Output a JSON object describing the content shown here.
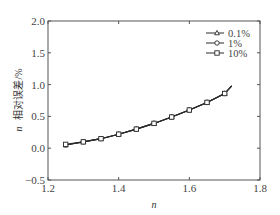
{
  "chart_data": {
    "type": "line",
    "title": "",
    "xlabel": "n",
    "ylabel": "n 相对误差/%",
    "ylabel_parts": {
      "var": "n",
      "text": "相对误差/%"
    },
    "xlim": [
      1.2,
      1.8
    ],
    "ylim": [
      -0.5,
      2.0
    ],
    "xticks": [
      1.2,
      1.4,
      1.6,
      1.8
    ],
    "xtick_labels": [
      "1.2",
      "1.4",
      "1.6",
      "1.8"
    ],
    "yticks": [
      -0.5,
      0.0,
      0.5,
      1.0,
      1.5,
      2.0
    ],
    "ytick_labels": [
      "−0.5",
      "0.0",
      "0.5",
      "1.0",
      "1.5",
      "2.0"
    ],
    "grid": false,
    "legend_position": "upper right",
    "line_end": {
      "x": 1.72,
      "y": 0.98
    },
    "x": [
      1.25,
      1.3,
      1.35,
      1.4,
      1.45,
      1.5,
      1.55,
      1.6,
      1.65,
      1.7
    ],
    "series": [
      {
        "name": "0.1%",
        "marker": "triangle",
        "values": [
          0.05,
          0.1,
          0.15,
          0.22,
          0.3,
          0.39,
          0.49,
          0.6,
          0.72,
          0.86
        ]
      },
      {
        "name": "1%",
        "marker": "circle",
        "values": [
          0.05,
          0.1,
          0.15,
          0.22,
          0.3,
          0.39,
          0.49,
          0.6,
          0.72,
          0.86
        ]
      },
      {
        "name": "10%",
        "marker": "square",
        "values": [
          0.06,
          0.1,
          0.15,
          0.22,
          0.3,
          0.39,
          0.49,
          0.6,
          0.72,
          0.86
        ]
      }
    ],
    "colors": {
      "line": "#2a2a2a",
      "axis": "#555555",
      "marker_fill": "#ffffff"
    }
  }
}
